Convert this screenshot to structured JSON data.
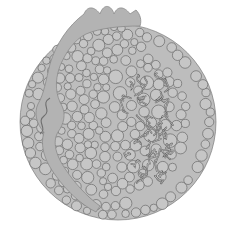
{
  "figure": {
    "labels": [],
    "colors": {
      "background": "#ffffff",
      "sphere_fill": "#c6c6c6",
      "sphere_stroke": "#6a6a6a",
      "protein_band": "#b3b3b3",
      "protein_stroke": "#8a8a8a",
      "tail_stroke": "#7a7a7a",
      "core_fill": "#bdbdbd"
    },
    "components": [
      {
        "name": "phospholipid-heads",
        "description": "outer shell of packed spheres"
      },
      {
        "name": "apolipoprotein-band",
        "description": "curved protein band wrapping particle with knobbed top"
      },
      {
        "name": "fatty-acid-tails",
        "description": "radial striped lipid tails on right side"
      },
      {
        "name": "core-lipid-chains",
        "description": "tangled chains in inner core"
      }
    ]
  }
}
